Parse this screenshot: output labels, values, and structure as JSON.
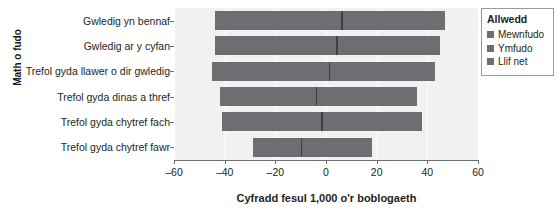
{
  "chart_data": {
    "type": "bar",
    "subtype": "diverging-horizontal-bar-with-net-marker",
    "title": "",
    "xlabel": "Cyfradd fesul 1,000 o'r boblogaeth",
    "ylabel": "Math o fudo",
    "xlim": [
      -60,
      60
    ],
    "xticks": [
      -60,
      -40,
      -20,
      0,
      20,
      40,
      60
    ],
    "xtick_labels": [
      "–60",
      "–40",
      "–20",
      "0",
      "20",
      "40",
      "60"
    ],
    "grid": true,
    "grid_axis": "x",
    "legend_position": "right-outside",
    "categories": [
      "Gwledig yn bennaf",
      "Gwledig ar y cyfan",
      "Trefol gyda llawer o dir gwledig",
      "Trefol gyda dinas a thref",
      "Trefol gyda chytref fach",
      "Trefol gyda chytref fawr"
    ],
    "series": [
      {
        "name": "Ymfudo",
        "values": [
          -44,
          -44,
          -45,
          -42,
          -41,
          -29
        ]
      },
      {
        "name": "Mewnfudo",
        "values": [
          47,
          45,
          43,
          36,
          38,
          18
        ]
      },
      {
        "name": "Llif net",
        "values": [
          6,
          4,
          1,
          -4,
          -2,
          -10
        ]
      }
    ],
    "colors": {
      "bar": "#6d6e71",
      "net_marker": "#3f4042",
      "plot_background": "#f1f1f1",
      "gridline": "#ffffff",
      "axis": "#6d6e71",
      "text": "#231f20"
    }
  },
  "legend": {
    "title": "Allwedd",
    "items": [
      {
        "label": "Mewnfudo",
        "color": "#6d6e71"
      },
      {
        "label": "Ymfudo",
        "color": "#6d6e71"
      },
      {
        "label": "Llif net",
        "color": "#6d6e71"
      }
    ]
  }
}
